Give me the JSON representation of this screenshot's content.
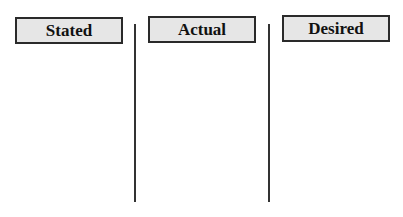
{
  "columns": [
    {
      "label": "Stated"
    },
    {
      "label": "Actual"
    },
    {
      "label": "Desired"
    }
  ],
  "colors": {
    "box_fill": "#e6e6e6",
    "border": "#2a2a2a",
    "divider": "#333333"
  }
}
